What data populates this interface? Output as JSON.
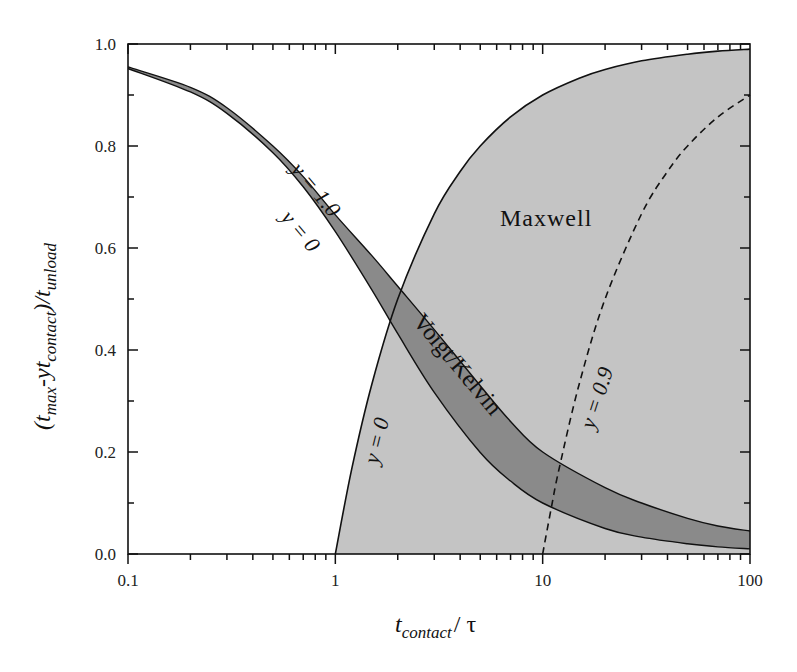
{
  "chart_data": {
    "type": "area",
    "title": "",
    "xlabel": "t_contact / τ",
    "ylabel": "(t_max - y t_contact) / t_unload",
    "xscale": "log",
    "xlim": [
      0.1,
      100
    ],
    "ylim": [
      0.0,
      1.0
    ],
    "xticks": [
      "0.1",
      "1",
      "10",
      "100"
    ],
    "yticks": [
      "0.0",
      "0.2",
      "0.4",
      "0.6",
      "0.8",
      "1.0"
    ],
    "grid": false,
    "series": [
      {
        "name": "Maxwell y = 0",
        "style": "solid",
        "x": [
          1,
          1.2,
          1.5,
          2,
          3,
          4,
          5,
          7,
          10,
          15,
          20,
          30,
          50,
          70,
          100
        ],
        "values": [
          0,
          0.167,
          0.333,
          0.5,
          0.667,
          0.75,
          0.8,
          0.857,
          0.9,
          0.933,
          0.95,
          0.967,
          0.98,
          0.986,
          0.99
        ]
      },
      {
        "name": "Maxwell y = 0.9",
        "style": "dashed",
        "x": [
          10,
          11,
          12,
          15,
          20,
          30,
          40,
          50,
          70,
          100
        ],
        "values": [
          0,
          0.09,
          0.167,
          0.333,
          0.5,
          0.667,
          0.75,
          0.8,
          0.857,
          0.9
        ]
      },
      {
        "name": "Voigt/Kelvin y = 1.0",
        "style": "solid",
        "x": [
          0.1,
          0.2,
          0.3,
          0.5,
          0.7,
          1,
          1.5,
          2,
          3,
          5,
          7,
          10,
          20,
          30,
          50,
          70,
          100
        ],
        "values": [
          0.955,
          0.915,
          0.875,
          0.8,
          0.74,
          0.665,
          0.585,
          0.525,
          0.44,
          0.33,
          0.26,
          0.2,
          0.13,
          0.1,
          0.07,
          0.055,
          0.045
        ]
      },
      {
        "name": "Voigt/Kelvin y = 0",
        "style": "solid",
        "x": [
          0.1,
          0.2,
          0.3,
          0.5,
          0.7,
          1,
          1.5,
          2,
          3,
          5,
          7,
          10,
          20,
          30,
          50,
          70,
          100
        ],
        "values": [
          0.952,
          0.906,
          0.864,
          0.787,
          0.72,
          0.632,
          0.518,
          0.432,
          0.317,
          0.199,
          0.143,
          0.1,
          0.05,
          0.033,
          0.02,
          0.014,
          0.01
        ]
      }
    ],
    "regions": [
      {
        "name": "Maxwell",
        "fill": "#c4c4c4",
        "between": [
          "Maxwell y = 0",
          "top"
        ]
      },
      {
        "name": "Voigt/Kelvin",
        "fill": "#8a8a8a",
        "between": [
          "Voigt/Kelvin y = 1.0",
          "Voigt/Kelvin y = 0"
        ]
      }
    ],
    "annotations": [
      {
        "text": "y = 1.0",
        "target": "Voigt/Kelvin upper"
      },
      {
        "text": "y = 0",
        "target": "Voigt/Kelvin lower"
      },
      {
        "text": "y = 0",
        "target": "Maxwell solid"
      },
      {
        "text": "y = 0.9",
        "target": "Maxwell dashed"
      },
      {
        "text": "Maxwell",
        "target": "region"
      },
      {
        "text": "Voigt/Kelvin",
        "target": "region"
      }
    ]
  },
  "labels": {
    "x_axis_main": "t",
    "x_axis_sub": "contact",
    "x_axis_rest": "/ τ",
    "y_axis_open": "(t",
    "y_axis_sub1": "max",
    "y_axis_mid": "-yt",
    "y_axis_sub2": "contact",
    "y_axis_close": ")/t",
    "y_axis_sub3": "unload",
    "maxwell": "Maxwell",
    "voigt": "Voigt/Kelvin",
    "vk_upper": "y = 1.0",
    "vk_lower": "y = 0",
    "mx_solid": "y = 0",
    "mx_dashed": "y = 0.9"
  },
  "colors": {
    "maxwell_fill": "#c4c4c4",
    "voigt_fill": "#8a8a8a",
    "line": "#111111"
  }
}
